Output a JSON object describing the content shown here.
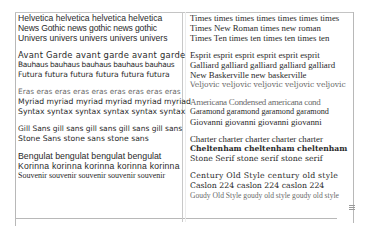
{
  "document": {
    "type": "font specimen table",
    "left_column": {
      "groups": [
        {
          "lines": [
            "Helvetica helvetica helvetica helvetica",
            "News Gothic news gothic news gothic",
            "Univers univers univers univers univers"
          ]
        },
        {
          "lines": [
            "Avant Garde avant garde avant garde",
            "Bauhaus bauhaus bauhaus bauhaus bauhaus",
            "Futura futura futura futura futura futura"
          ]
        },
        {
          "lines": [
            "Eras eras eras eras eras eras eras eras eras",
            "Myriad myriad myriad myriad myriad myriad",
            "Syntax syntax syntax syntax syntax syntax"
          ]
        },
        {
          "lines": [
            "Gill Sans gill sans gill sans gill sans gill sans",
            "Stone Sans stone sans stone sans"
          ]
        },
        {
          "lines": [
            "Bengulat bengulat bengulat bengulat",
            "Korinna korinna korinna korinna korinna",
            "Souvenir souvenir souvenir souvenir souvenir"
          ]
        }
      ]
    },
    "right_column": {
      "groups": [
        {
          "lines": [
            "Times times times times times times times",
            "Times New Roman times new roman",
            "Times Ten times ten times ten times ten"
          ]
        },
        {
          "lines": [
            "Esprit esprit esprit esprit esprit esprit",
            "Galliard galliard galliard galliard galliard",
            "New Baskerville new baskerville",
            "Veljovic veljovic veljovic veljovic veljovic"
          ]
        },
        {
          "lines": [
            "Americana Condensed americana cond",
            "Garamond garamond garamond garamond",
            "Giovanni giovanni giovanni giovanni"
          ]
        },
        {
          "lines": [
            "Charter charter charter charter charter",
            "Cheltenham cheltenham cheltenham",
            "Stone Serif stone serif stone serif"
          ]
        },
        {
          "lines": [
            "Century Old Style century old style",
            "Caslon 224 caslon 224 caslon 224",
            "Goudy Old Style goudy old style goudy old style"
          ]
        }
      ]
    }
  },
  "icons": {
    "resize_grip": "resize-grip-icon"
  },
  "colors": {
    "text": "#2a2a2a",
    "light_text": "#6a6a6a",
    "border": "#b8b8b8",
    "background": "#ffffff"
  }
}
